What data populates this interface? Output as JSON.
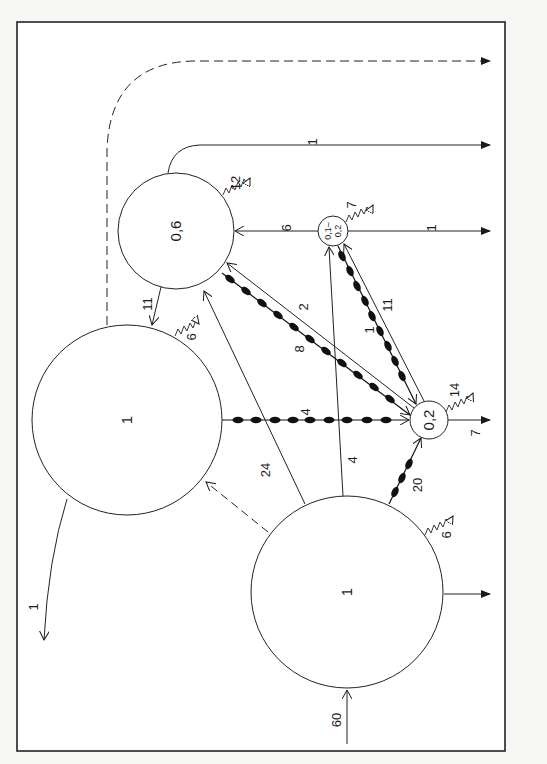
{
  "diagram": {
    "type": "flow-compartment-diagram",
    "orientation": "rotated 90deg (text reads bottom-to-top)",
    "nodes": [
      {
        "id": "A",
        "label": "1",
        "cx": 347,
        "cy": 592,
        "r": 96
      },
      {
        "id": "B",
        "label": "1",
        "cx": 127,
        "cy": 420,
        "r": 95
      },
      {
        "id": "C",
        "label": "0,6",
        "cx": 176,
        "cy": 231,
        "r": 58
      },
      {
        "id": "D",
        "label": "0,1–0,2",
        "label_top": "0,1–",
        "label_bottom": "0,2",
        "cx": 333,
        "cy": 231,
        "r": 15
      },
      {
        "id": "E",
        "label": "0,2",
        "cx": 429,
        "cy": 420,
        "r": 19
      }
    ],
    "flows": {
      "input_A": "60",
      "A_to_out": "6",
      "A_heat": "6",
      "A_to_B_dashed": "",
      "A_to_C": "24",
      "A_to_D": "4",
      "A_to_E_beaded": "20",
      "B_to_E_beaded": "4",
      "B_heat": "6",
      "B_out": "1",
      "C_to_B": "11",
      "C_heat": "12",
      "C_out": "1",
      "C_to_E_beaded": "8",
      "E_to_C": "2",
      "D_to_C": "6",
      "D_heat": "7",
      "D_out": "1",
      "D_to_E_beaded": "1",
      "E_to_D": "11",
      "E_heat": "14",
      "E_out": "7",
      "dashed_export": ""
    },
    "legend_semantics": {
      "solid_arrow": "flow",
      "beaded_arrow": "special flow (beaded line)",
      "dashed_arrow": "indirect flow",
      "zigzag_arrow": "heat/respiration loss"
    }
  }
}
